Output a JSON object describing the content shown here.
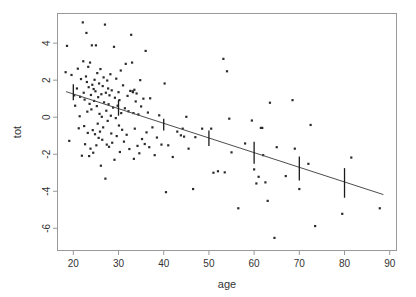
{
  "chart_data": {
    "type": "scatter",
    "title": "",
    "xlabel": "age",
    "ylabel": "tot",
    "xlim": [
      16.5,
      91.5
    ],
    "ylim": [
      -7.2,
      5.6
    ],
    "xticks": [
      20,
      30,
      40,
      50,
      60,
      70,
      80,
      90
    ],
    "yticks": [
      4,
      2,
      0,
      -2,
      -4,
      -6
    ],
    "grid": false,
    "legend": null,
    "point_color": "#2b2b2b",
    "line_color": "#4d4d4d",
    "box_color": "#999999",
    "fit_line": {
      "x0": 18.4,
      "y0": 1.38,
      "x1": 88.6,
      "y1": -4.18,
      "slope": -0.0792,
      "intercept": 2.838
    },
    "error_bars": [
      {
        "x": 20,
        "lo": 0.92,
        "hi": 1.78,
        "mid": 1.29
      },
      {
        "x": 30,
        "lo": 0.08,
        "hi": 0.92,
        "mid": 0.47
      },
      {
        "x": 40,
        "lo": -0.72,
        "hi": -0.08,
        "mid": -0.38
      },
      {
        "x": 50,
        "lo": -1.55,
        "hi": -0.72,
        "mid": -1.15
      },
      {
        "x": 60,
        "lo": -2.52,
        "hi": -1.32,
        "mid": -1.88
      },
      {
        "x": 70,
        "lo": -3.42,
        "hi": -2.12,
        "mid": -2.74
      },
      {
        "x": 80,
        "lo": -4.35,
        "hi": -2.75,
        "mid": -3.55
      }
    ],
    "points": [
      [
        18.3,
        2.43
      ],
      [
        18.6,
        3.85
      ],
      [
        19.1,
        -1.28
      ],
      [
        19.6,
        2.28
      ],
      [
        20.2,
        1.18
      ],
      [
        20.4,
        0.62
      ],
      [
        20.8,
        1.55
      ],
      [
        21.0,
        2.62
      ],
      [
        21.2,
        -0.6
      ],
      [
        21.4,
        0.05
      ],
      [
        21.5,
        1.1
      ],
      [
        21.7,
        2.06
      ],
      [
        21.9,
        -2.08
      ],
      [
        22.1,
        5.12
      ],
      [
        22.2,
        3.02
      ],
      [
        22.3,
        1.32
      ],
      [
        22.4,
        -0.48
      ],
      [
        22.5,
        0.95
      ],
      [
        22.6,
        -1.46
      ],
      [
        22.8,
        2.2
      ],
      [
        22.9,
        4.55
      ],
      [
        23.0,
        1.9
      ],
      [
        23.1,
        0.3
      ],
      [
        23.2,
        -0.85
      ],
      [
        23.3,
        2.72
      ],
      [
        23.4,
        1.62
      ],
      [
        23.5,
        -2.1
      ],
      [
        23.6,
        0.72
      ],
      [
        23.7,
        2.95
      ],
      [
        23.8,
        -1.7
      ],
      [
        23.9,
        1.2
      ],
      [
        24.0,
        0.42
      ],
      [
        24.1,
        3.88
      ],
      [
        24.2,
        1.75
      ],
      [
        24.3,
        -0.7
      ],
      [
        24.4,
        -1.92
      ],
      [
        24.5,
        1.52
      ],
      [
        24.6,
        0.88
      ],
      [
        24.7,
        2.02
      ],
      [
        24.8,
        -0.92
      ],
      [
        24.9,
        1.4
      ],
      [
        25.0,
        3.88
      ],
      [
        25.1,
        -1.52
      ],
      [
        25.2,
        0.6
      ],
      [
        25.3,
        2.38
      ],
      [
        25.4,
        -0.35
      ],
      [
        25.5,
        1.08
      ],
      [
        25.6,
        -1.12
      ],
      [
        25.7,
        1.82
      ],
      [
        25.8,
        0.18
      ],
      [
        25.9,
        -0.78
      ],
      [
        26.0,
        2.6
      ],
      [
        26.1,
        -2.62
      ],
      [
        26.2,
        1.24
      ],
      [
        26.3,
        0.02
      ],
      [
        26.4,
        -1.22
      ],
      [
        26.5,
        1.68
      ],
      [
        26.6,
        -0.55
      ],
      [
        26.7,
        2.15
      ],
      [
        26.8,
        0.8
      ],
      [
        27.0,
        5.0
      ],
      [
        27.1,
        -3.32
      ],
      [
        27.2,
        1.32
      ],
      [
        27.3,
        0.35
      ],
      [
        27.4,
        -1.48
      ],
      [
        27.5,
        1.98
      ],
      [
        27.6,
        -0.2
      ],
      [
        27.7,
        1.55
      ],
      [
        27.8,
        0.7
      ],
      [
        27.9,
        -1.6
      ],
      [
        28.0,
        1.18
      ],
      [
        28.2,
        2.32
      ],
      [
        28.3,
        0.08
      ],
      [
        28.4,
        -0.88
      ],
      [
        28.5,
        1.45
      ],
      [
        28.6,
        -1.38
      ],
      [
        28.8,
        0.52
      ],
      [
        29.0,
        3.8
      ],
      [
        29.1,
        -2.3
      ],
      [
        29.2,
        1.05
      ],
      [
        29.4,
        -0.05
      ],
      [
        29.5,
        2.08
      ],
      [
        29.6,
        -1.02
      ],
      [
        29.8,
        0.62
      ],
      [
        30.0,
        1.35
      ],
      [
        30.1,
        -0.45
      ],
      [
        30.2,
        0.92
      ],
      [
        30.3,
        -1.88
      ],
      [
        30.5,
        2.52
      ],
      [
        30.6,
        0.22
      ],
      [
        30.8,
        -0.68
      ],
      [
        31.0,
        1.72
      ],
      [
        31.2,
        -1.32
      ],
      [
        31.4,
        0.48
      ],
      [
        31.6,
        2.88
      ],
      [
        31.8,
        -0.95
      ],
      [
        32.0,
        1.15
      ],
      [
        32.2,
        0.32
      ],
      [
        32.4,
        -1.72
      ],
      [
        32.6,
        1.42
      ],
      [
        32.8,
        4.45
      ],
      [
        33.0,
        2.95
      ],
      [
        33.1,
        1.4
      ],
      [
        33.2,
        1.35
      ],
      [
        33.3,
        0.22
      ],
      [
        33.4,
        -2.25
      ],
      [
        33.5,
        1.48
      ],
      [
        33.6,
        -0.62
      ],
      [
        33.8,
        0.85
      ],
      [
        34.0,
        1.28
      ],
      [
        34.2,
        -1.55
      ],
      [
        34.4,
        0.15
      ],
      [
        34.6,
        -1.95
      ],
      [
        34.8,
        2.0
      ],
      [
        35.0,
        0.58
      ],
      [
        35.2,
        -1.18
      ],
      [
        35.5,
        1.0
      ],
      [
        35.8,
        -1.45
      ],
      [
        36.0,
        3.58
      ],
      [
        36.2,
        -0.82
      ],
      [
        36.5,
        0.25
      ],
      [
        36.8,
        -1.62
      ],
      [
        37.0,
        1.02
      ],
      [
        37.5,
        -0.55
      ],
      [
        38.0,
        -2.05
      ],
      [
        38.5,
        -1.1
      ],
      [
        39.0,
        0.1
      ],
      [
        39.5,
        -1.48
      ],
      [
        40.2,
        1.82
      ],
      [
        40.5,
        -4.05
      ],
      [
        41.0,
        -1.52
      ],
      [
        42.0,
        -2.15
      ],
      [
        43.0,
        -0.78
      ],
      [
        43.8,
        -0.98
      ],
      [
        44.2,
        -0.62
      ],
      [
        44.5,
        -1.05
      ],
      [
        45.0,
        0.02
      ],
      [
        45.5,
        -1.7
      ],
      [
        46.5,
        -3.88
      ],
      [
        47.0,
        -1.08
      ],
      [
        48.5,
        -0.62
      ],
      [
        50.5,
        -0.62
      ],
      [
        51.0,
        -3.0
      ],
      [
        52.0,
        -2.92
      ],
      [
        53.2,
        3.15
      ],
      [
        53.5,
        -2.98
      ],
      [
        54.0,
        2.48
      ],
      [
        54.5,
        -0.08
      ],
      [
        55.0,
        -1.9
      ],
      [
        56.5,
        -4.92
      ],
      [
        58.0,
        -1.42
      ],
      [
        59.5,
        -0.18
      ],
      [
        60.0,
        -2.82
      ],
      [
        60.5,
        -3.58
      ],
      [
        61.0,
        -3.22
      ],
      [
        61.5,
        -0.58
      ],
      [
        61.8,
        -0.58
      ],
      [
        62.0,
        -2.05
      ],
      [
        62.5,
        -3.52
      ],
      [
        63.0,
        -4.52
      ],
      [
        63.5,
        0.78
      ],
      [
        64.5,
        -6.52
      ],
      [
        65.0,
        -1.62
      ],
      [
        67.0,
        -3.18
      ],
      [
        68.5,
        0.92
      ],
      [
        69.0,
        -1.7
      ],
      [
        70.0,
        -3.88
      ],
      [
        72.0,
        -2.52
      ],
      [
        72.5,
        -0.42
      ],
      [
        73.5,
        -5.88
      ],
      [
        79.5,
        -5.22
      ],
      [
        81.5,
        -2.18
      ],
      [
        87.8,
        -4.92
      ]
    ]
  },
  "axis": {
    "x_tick_labels": [
      "20",
      "30",
      "40",
      "50",
      "60",
      "70",
      "80",
      "90"
    ],
    "y_tick_labels": [
      "4",
      "2",
      "0",
      "-2",
      "-4",
      "-6"
    ],
    "x_title": "age",
    "y_title": "tot"
  }
}
